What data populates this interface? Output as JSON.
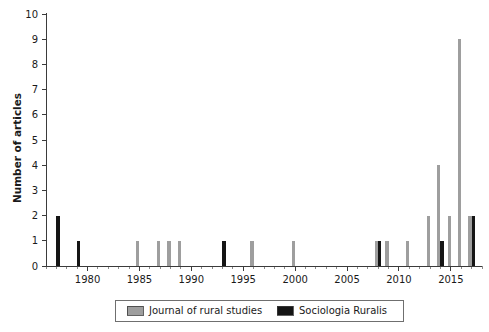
{
  "chart_data": {
    "type": "bar",
    "title": "",
    "subtitle": "",
    "xlabel": "",
    "ylabel": "Number of articles",
    "ylim": [
      0,
      10
    ],
    "xlim": [
      1976,
      2018
    ],
    "yticks": [
      0,
      1,
      2,
      3,
      4,
      5,
      6,
      7,
      8,
      9,
      10
    ],
    "xticks": [
      1980,
      1985,
      1990,
      1995,
      2000,
      2005,
      2010,
      2015
    ],
    "xtick_labels": [
      "1980",
      "1985",
      "1990",
      "1995",
      "2000",
      "2005",
      "2010",
      "2015"
    ],
    "x_minor_step": 1,
    "grid": false,
    "legend_position": "bottom",
    "bar_width_years": 0.55,
    "x": [
      1977,
      1978,
      1979,
      1980,
      1981,
      1982,
      1983,
      1984,
      1985,
      1986,
      1987,
      1988,
      1989,
      1990,
      1991,
      1992,
      1993,
      1994,
      1995,
      1996,
      1997,
      1998,
      1999,
      2000,
      2001,
      2002,
      2003,
      2004,
      2005,
      2006,
      2007,
      2008,
      2009,
      2010,
      2011,
      2012,
      2013,
      2014,
      2015,
      2016,
      2017
    ],
    "series": [
      {
        "name": "Journal of rural studies",
        "color": "#9e9e9e",
        "values": [
          0,
          0,
          0,
          0,
          0,
          0,
          0,
          0,
          1,
          0,
          1,
          1,
          1,
          0,
          0,
          0,
          0,
          0,
          0,
          1,
          0,
          0,
          0,
          1,
          0,
          0,
          0,
          0,
          0,
          0,
          0,
          1,
          1,
          0,
          1,
          0,
          2,
          4,
          2,
          9,
          2
        ]
      },
      {
        "name": "Sociologia Ruralis",
        "color": "#151515",
        "values": [
          2,
          0,
          1,
          0,
          0,
          0,
          0,
          0,
          0,
          0,
          0,
          0,
          0,
          0,
          0,
          0,
          1,
          0,
          0,
          0,
          0,
          0,
          0,
          0,
          0,
          0,
          0,
          0,
          0,
          0,
          0,
          1,
          0,
          0,
          0,
          0,
          0,
          1,
          0,
          0,
          2
        ]
      }
    ]
  },
  "legend": {
    "entries": [
      {
        "label": "Journal of rural studies",
        "color": "#9e9e9e"
      },
      {
        "label": "Sociologia Ruralis",
        "color": "#151515"
      }
    ]
  },
  "axes": {
    "y_title": "Number of articles"
  }
}
